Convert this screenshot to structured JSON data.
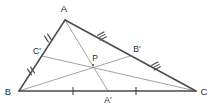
{
  "diagram": {
    "background_color": "#ffffff",
    "outline_color": "#4a4a4a",
    "median_color": "#8a8a8a",
    "tick_color": "#4a4a4a",
    "label_color": "#2b2b2b",
    "canvas": {
      "width": 212,
      "height": 106
    },
    "vertices": [
      {
        "id": "A",
        "label": "A",
        "x": 65,
        "y": 20,
        "label_x": 64,
        "label_y": 12
      },
      {
        "id": "B",
        "label": "B",
        "x": 19,
        "y": 91,
        "label_x": 8,
        "label_y": 95
      },
      {
        "id": "C",
        "label": "C",
        "x": 196,
        "y": 91,
        "label_x": 201,
        "label_y": 95
      }
    ],
    "midpoints": [
      {
        "id": "A-prime",
        "label": "A'",
        "x": 108,
        "y": 91,
        "label_x": 105,
        "label_y": 102,
        "on_side": "BC"
      },
      {
        "id": "B-prime",
        "label": "B'",
        "x": 130,
        "y": 56,
        "label_x": 133,
        "label_y": 52,
        "on_side": "AC"
      },
      {
        "id": "C-prime",
        "label": "C'",
        "x": 42,
        "y": 56,
        "label_x": 33,
        "label_y": 53,
        "on_side": "AB"
      }
    ],
    "centroid": {
      "id": "P",
      "label": "P",
      "x": 93,
      "y": 65,
      "label_x": 90,
      "label_y": 61
    },
    "sides": [
      {
        "id": "side-AB",
        "from": "A",
        "to": "B",
        "x1": 65,
        "y1": 20,
        "x2": 19,
        "y2": 91
      },
      {
        "id": "side-AC",
        "from": "A",
        "to": "C",
        "x1": 65,
        "y1": 20,
        "x2": 196,
        "y2": 91
      },
      {
        "id": "side-BC",
        "from": "B",
        "to": "C",
        "x1": 19,
        "y1": 91,
        "x2": 196,
        "y2": 91
      }
    ],
    "medians": [
      {
        "id": "median-A-Aprime",
        "from": "A",
        "to": "A'",
        "x1": 65,
        "y1": 20,
        "x2": 108,
        "y2": 91
      },
      {
        "id": "median-B-Bprime",
        "from": "B",
        "to": "B'",
        "x1": 19,
        "y1": 91,
        "x2": 130,
        "y2": 56
      },
      {
        "id": "median-C-Cprime",
        "from": "C",
        "to": "C'",
        "x1": 196,
        "y1": 91,
        "x2": 42,
        "y2": 56
      }
    ],
    "tick_marks": [
      {
        "id": "tick-A-Cprime",
        "segment": "A-C'",
        "count": 2,
        "cx": 48,
        "cy": 38,
        "angle": 57
      },
      {
        "id": "tick-B-Cprime",
        "segment": "B-C'",
        "count": 2,
        "cx": 31,
        "cy": 73,
        "angle": 57
      },
      {
        "id": "tick-A-Bprime",
        "segment": "A-B'",
        "count": 3,
        "cx": 102,
        "cy": 36,
        "angle": -28
      },
      {
        "id": "tick-Bprime-C",
        "segment": "B'-C",
        "count": 3,
        "cx": 156,
        "cy": 66,
        "angle": -28
      },
      {
        "id": "tick-B-Aprime",
        "segment": "B-A'",
        "count": 1,
        "cx": 73,
        "cy": 91,
        "angle": 0
      },
      {
        "id": "tick-Aprime-C",
        "segment": "A'-C",
        "count": 1,
        "cx": 136,
        "cy": 91,
        "angle": 0
      }
    ]
  }
}
